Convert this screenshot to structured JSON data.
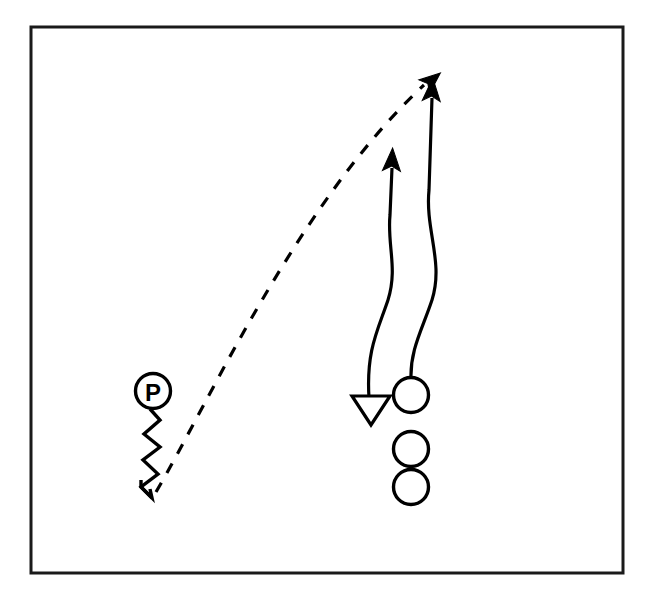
{
  "diagram": {
    "type": "football-play-diagram",
    "background_color": "#ffffff",
    "ink_color": "#000000",
    "frame": {
      "name": "field-frame",
      "x": 31,
      "y": 27,
      "width": 592,
      "height": 546,
      "stroke": "#1a1a1a",
      "stroke_width": 3
    },
    "passer": {
      "label": "P",
      "cx": 153,
      "cy": 391,
      "r": 17.5,
      "description": "circled passer marker"
    },
    "scramble_path": {
      "name": "scramble-zigzag",
      "d": "M 150 409 L 160 420 L 144 434 L 160 447 L 143 460 L 158 474 L 141 487 L 152 498",
      "arrow_d": "M 141 480 L 141 487 L 152 498 L 150 489",
      "description": "zigzag motion trail below the passer"
    },
    "pass_route": {
      "name": "pass-trajectory",
      "style": "dashed",
      "dash_pattern": "11 11",
      "d": "M 156 492 C 210 400 300 200 424 85",
      "arrowhead": {
        "x": 432,
        "y": 80,
        "angle_deg": -40
      },
      "description": "dashed arc from passer to target"
    },
    "routes": [
      {
        "name": "route-left",
        "d": "M 369 398 C 366 350 378 330 388 300 C 398 268 387 245 390 215 L 392 168",
        "start": {
          "x": 369,
          "y": 398
        },
        "end": {
          "x": 392,
          "y": 160
        },
        "head": "solid-up-arrow",
        "tail": "hollow-down-triangle"
      },
      {
        "name": "route-right",
        "d": "M 411 379 C 410 350 422 330 432 300 C 444 262 425 230 429 190 L 432 98",
        "start": {
          "x": 411,
          "y": 379
        },
        "end": {
          "x": 432,
          "y": 90
        },
        "head": "solid-up-arrow",
        "tail": "none"
      }
    ],
    "block_marker": {
      "name": "hollow-down-triangle",
      "points": "352,396 390,396 371,425",
      "description": "hollow downward triangle at the end of the left route"
    },
    "players": [
      {
        "name": "player-circle-1",
        "cx": 411,
        "cy": 395,
        "r": 17.5
      },
      {
        "name": "player-circle-2",
        "cx": 411,
        "cy": 449,
        "r": 17.5
      },
      {
        "name": "player-circle-3",
        "cx": 411,
        "cy": 487,
        "r": 17.5
      }
    ]
  }
}
